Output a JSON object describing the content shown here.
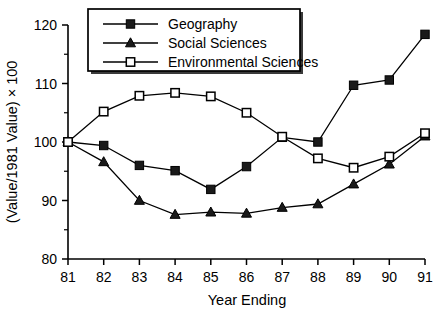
{
  "chart_data": {
    "type": "line",
    "title": "",
    "xlabel": "Year Ending",
    "ylabel": "(Value/1981 Value) × 100",
    "categories": [
      "81",
      "82",
      "83",
      "84",
      "85",
      "86",
      "87",
      "88",
      "89",
      "90",
      "91"
    ],
    "x": [
      81,
      82,
      83,
      84,
      85,
      86,
      87,
      88,
      89,
      90,
      91
    ],
    "xlim": [
      81,
      91
    ],
    "ylim": [
      80,
      120
    ],
    "yticks": [
      80,
      90,
      100,
      110,
      120
    ],
    "ytick_labels": [
      "80",
      "90",
      "100",
      "110",
      "120"
    ],
    "yticks_minor": [
      85,
      95,
      105,
      115
    ],
    "grid": false,
    "legend_position": "top-center",
    "series": [
      {
        "name": "Geography",
        "marker": "filled-square",
        "values": [
          100,
          99.4,
          96,
          95.1,
          91.9,
          95.8,
          100.8,
          100,
          109.7,
          110.6,
          118.4
        ]
      },
      {
        "name": "Social Sciences",
        "marker": "filled-triangle",
        "values": [
          100,
          96.6,
          90,
          87.6,
          88,
          87.8,
          88.8,
          89.4,
          92.8,
          96.2,
          101
        ]
      },
      {
        "name": "Environmental Sciences",
        "marker": "open-square",
        "values": [
          100,
          105.2,
          107.9,
          108.4,
          107.8,
          105,
          100.9,
          97.2,
          95.6,
          97.5,
          101.5
        ]
      }
    ]
  },
  "legend": {
    "entries": [
      {
        "label": "Geography",
        "marker": "filled-square"
      },
      {
        "label": "Social Sciences",
        "marker": "filled-triangle"
      },
      {
        "label": "Environmental Sciences",
        "marker": "open-square"
      }
    ]
  },
  "axes": {
    "x_title": "Year Ending",
    "y_title": "(Value/1981 Value) × 100"
  },
  "colors": {
    "line": "#000000",
    "marker_fill": "#1a1a1a",
    "marker_open_fill": "#ffffff",
    "background": "#ffffff",
    "text": "#000000"
  }
}
